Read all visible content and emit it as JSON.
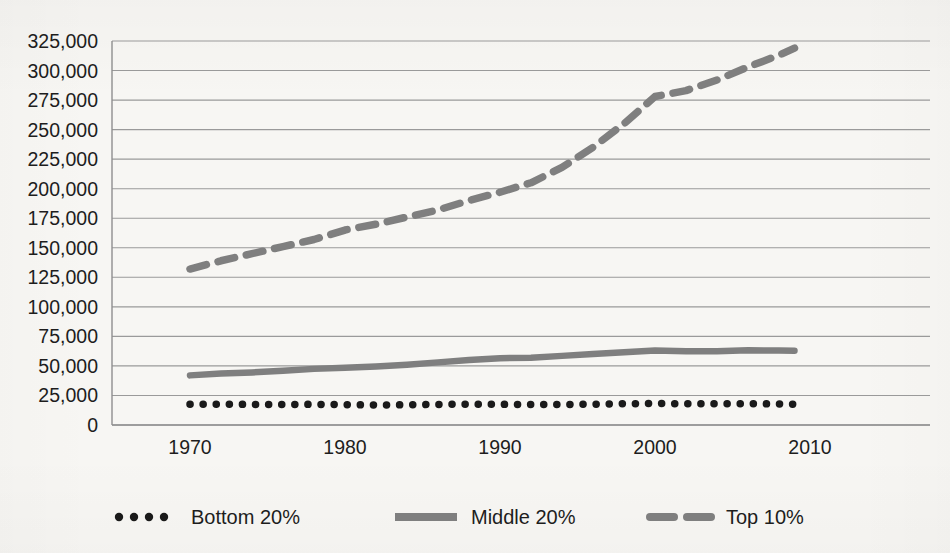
{
  "chart_data": {
    "type": "line",
    "title": "",
    "subtitle": "",
    "xlabel": "",
    "ylabel": "",
    "xlim": [
      1967,
      2017
    ],
    "ylim": [
      0,
      325000
    ],
    "ytick_step": 25000,
    "grid": true,
    "legend_position": "bottom",
    "x_ticks": [
      "1970",
      "1980",
      "1990",
      "2000",
      "2010"
    ],
    "x_tick_values": [
      1970,
      1980,
      1990,
      2000,
      2010
    ],
    "y_ticks": [
      "0",
      "25,000",
      "50,000",
      "75,000",
      "100,000",
      "125,000",
      "150,000",
      "175,000",
      "200,000",
      "225,000",
      "250,000",
      "275,000",
      "300,000",
      "325,000"
    ],
    "y_tick_values": [
      0,
      25000,
      50000,
      75000,
      100000,
      125000,
      150000,
      175000,
      200000,
      225000,
      250000,
      275000,
      300000,
      325000
    ],
    "x": [
      1970,
      1972,
      1974,
      1976,
      1978,
      1980,
      1982,
      1984,
      1986,
      1988,
      1990,
      1992,
      1994,
      1996,
      1998,
      2000,
      2002,
      2004,
      2006,
      2008,
      2009
    ],
    "series": [
      {
        "name": "Bottom 20%",
        "style": "dotted",
        "color": "#1a1a1a",
        "values": [
          17500,
          17600,
          17400,
          17300,
          17500,
          17200,
          16900,
          17100,
          17400,
          17600,
          17500,
          17300,
          17400,
          17600,
          18000,
          18200,
          18000,
          17900,
          18000,
          17800,
          17600
        ]
      },
      {
        "name": "Middle 20%",
        "style": "solid",
        "color": "#7f7f7f",
        "values": [
          42000,
          43500,
          44500,
          46000,
          47500,
          48500,
          49500,
          51000,
          53000,
          55000,
          56500,
          57000,
          58500,
          60000,
          61500,
          63000,
          62500,
          62500,
          63200,
          63000,
          62800
        ]
      },
      {
        "name": "Top 10%",
        "style": "dashed",
        "color": "#7f7f7f",
        "values": [
          132000,
          139000,
          145000,
          151000,
          157000,
          165000,
          170000,
          176000,
          182000,
          190000,
          197000,
          205000,
          218000,
          235000,
          255000,
          278000,
          283000,
          292000,
          303000,
          313000,
          319000
        ]
      }
    ],
    "legend": [
      {
        "label": "Bottom 20%",
        "style": "dotted",
        "color": "#1a1a1a"
      },
      {
        "label": "Middle 20%",
        "style": "solid",
        "color": "#7f7f7f"
      },
      {
        "label": "Top 10%",
        "style": "dashed",
        "color": "#7f7f7f"
      }
    ],
    "colors": {
      "grid": "#9a9a9a",
      "axis": "#8f8f8f",
      "text": "#1d1d1d",
      "background": "#f7f6f3"
    }
  }
}
